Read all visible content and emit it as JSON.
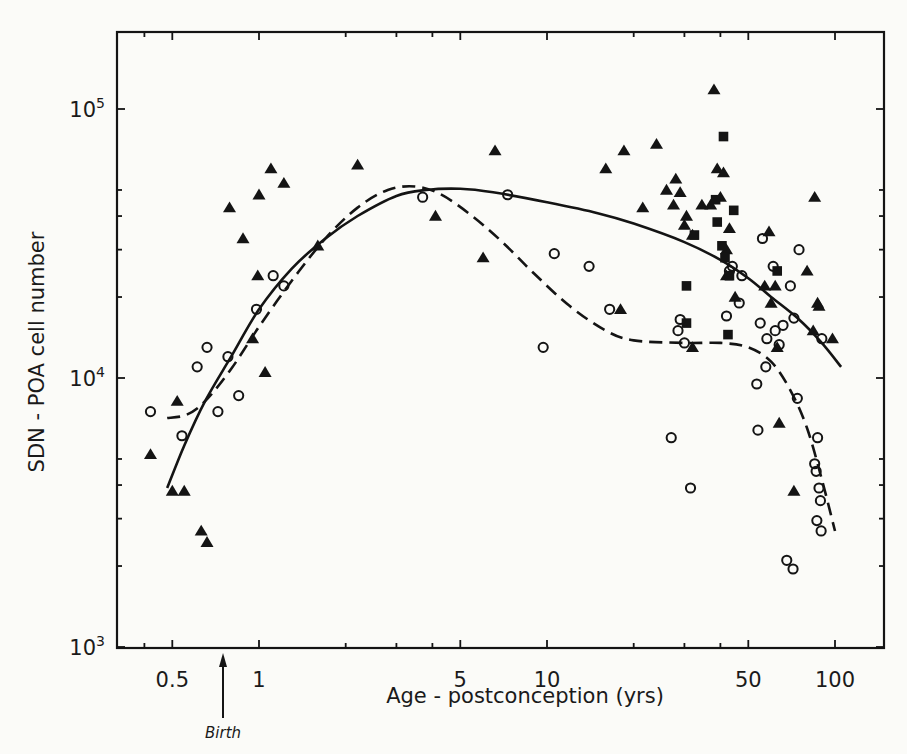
{
  "chart_data": {
    "type": "scatter",
    "title": "",
    "xlabel": "Age - postconception (yrs)",
    "ylabel": "SDN - POA cell number",
    "xscale": "log",
    "yscale": "log",
    "xlim": [
      0.32,
      160
    ],
    "ylim": [
      1000,
      200000
    ],
    "grid": false,
    "x_ticks": [
      {
        "value": 0.5,
        "label": "0.5"
      },
      {
        "value": 1,
        "label": "1"
      },
      {
        "value": 5,
        "label": "5"
      },
      {
        "value": 10,
        "label": "10"
      },
      {
        "value": 50,
        "label": "50"
      },
      {
        "value": 100,
        "label": "100"
      }
    ],
    "x_minor_ticks": [
      0.4,
      0.5,
      1,
      2,
      3,
      4,
      5,
      10,
      20,
      30,
      40,
      50,
      100
    ],
    "y_ticks": [
      {
        "value": 1000,
        "base": "10",
        "exp": "3"
      },
      {
        "value": 10000,
        "base": "10",
        "exp": "4"
      },
      {
        "value": 100000,
        "base": "10",
        "exp": "5"
      }
    ],
    "y_minor_ticks": [
      2000,
      3000,
      4000,
      5000,
      20000,
      30000,
      40000,
      50000
    ],
    "annotation": {
      "label": "Birth",
      "x": 0.75
    },
    "series": [
      {
        "name": "triangles",
        "marker": "triangle-filled",
        "points": [
          [
            0.42,
            5200
          ],
          [
            0.52,
            8200
          ],
          [
            0.5,
            3800
          ],
          [
            0.55,
            3800
          ],
          [
            0.63,
            2700
          ],
          [
            0.66,
            2450
          ],
          [
            0.79,
            43000
          ],
          [
            0.88,
            33000
          ],
          [
            0.95,
            14000
          ],
          [
            1.0,
            48000
          ],
          [
            0.99,
            24000
          ],
          [
            1.1,
            60000
          ],
          [
            1.22,
            53000
          ],
          [
            1.05,
            10500
          ],
          [
            1.6,
            31000
          ],
          [
            2.2,
            62000
          ],
          [
            4.1,
            40000
          ],
          [
            6.0,
            28000
          ],
          [
            6.6,
            70000
          ],
          [
            16.0,
            60000
          ],
          [
            18.0,
            18000
          ],
          [
            18.5,
            70000
          ],
          [
            21.5,
            43000
          ],
          [
            24.0,
            74000
          ],
          [
            26.0,
            50000
          ],
          [
            27.5,
            44000
          ],
          [
            28.0,
            55000
          ],
          [
            29.0,
            49000
          ],
          [
            30.5,
            40000
          ],
          [
            30.0,
            37000
          ],
          [
            32.0,
            34000
          ],
          [
            32.0,
            13000
          ],
          [
            34.5,
            44000
          ],
          [
            37.0,
            44000
          ],
          [
            38.0,
            118000
          ],
          [
            39.0,
            60000
          ],
          [
            40.0,
            47000
          ],
          [
            41.0,
            58000
          ],
          [
            42.0,
            30000
          ],
          [
            43.0,
            36000
          ],
          [
            45.0,
            20000
          ],
          [
            42.0,
            24000
          ],
          [
            59.0,
            35000
          ],
          [
            60.0,
            19000
          ],
          [
            62.0,
            22000
          ],
          [
            63.0,
            13000
          ],
          [
            64.0,
            6800
          ],
          [
            72.0,
            3800
          ],
          [
            80.0,
            25000
          ],
          [
            85.0,
            47000
          ],
          [
            87.0,
            19000
          ],
          [
            88.0,
            18500
          ],
          [
            84.0,
            15000
          ],
          [
            98.0,
            14000
          ],
          [
            57.0,
            22000
          ]
        ]
      },
      {
        "name": "squares",
        "marker": "square-filled",
        "points": [
          [
            41.0,
            79000
          ],
          [
            44.5,
            42000
          ],
          [
            39.0,
            38000
          ],
          [
            40.5,
            31000
          ],
          [
            32.5,
            34000
          ],
          [
            30.5,
            22000
          ],
          [
            41.5,
            28000
          ],
          [
            43.0,
            24000
          ],
          [
            30.5,
            16000
          ],
          [
            42.5,
            14500
          ],
          [
            63.0,
            25000
          ],
          [
            38.5,
            46000
          ]
        ]
      },
      {
        "name": "open-circles",
        "marker": "circle-open",
        "points": [
          [
            0.42,
            7500
          ],
          [
            0.54,
            6100
          ],
          [
            0.61,
            11000
          ],
          [
            0.66,
            13000
          ],
          [
            0.72,
            7500
          ],
          [
            0.78,
            12000
          ],
          [
            0.85,
            8600
          ],
          [
            0.98,
            18000
          ],
          [
            1.12,
            24000
          ],
          [
            1.22,
            22000
          ],
          [
            3.7,
            47000
          ],
          [
            7.3,
            48000
          ],
          [
            9.7,
            13000
          ],
          [
            10.6,
            29000
          ],
          [
            14.0,
            26000
          ],
          [
            16.5,
            18000
          ],
          [
            27.0,
            6000
          ],
          [
            28.5,
            15000
          ],
          [
            29.0,
            16500
          ],
          [
            30.0,
            13500
          ],
          [
            31.5,
            3900
          ],
          [
            42.0,
            17000
          ],
          [
            43.0,
            25000
          ],
          [
            44.0,
            26000
          ],
          [
            46.5,
            19000
          ],
          [
            47.5,
            24000
          ],
          [
            53.5,
            9500
          ],
          [
            54.0,
            6400
          ],
          [
            55.0,
            16000
          ],
          [
            56.0,
            33000
          ],
          [
            57.5,
            11000
          ],
          [
            58.0,
            14000
          ],
          [
            61.0,
            26000
          ],
          [
            62.0,
            15000
          ],
          [
            64.0,
            13300
          ],
          [
            66.0,
            15700
          ],
          [
            68.0,
            2100
          ],
          [
            70.0,
            22000
          ],
          [
            71.5,
            1950
          ],
          [
            74.0,
            8400
          ],
          [
            72.0,
            16700
          ],
          [
            75.0,
            30000
          ],
          [
            87.0,
            6000
          ],
          [
            85.0,
            4800
          ],
          [
            86.0,
            4500
          ],
          [
            88.0,
            3900
          ],
          [
            89.0,
            3500
          ],
          [
            86.5,
            2950
          ],
          [
            89.5,
            2700
          ],
          [
            90.0,
            14000
          ]
        ]
      }
    ],
    "curves": [
      {
        "name": "solid-fit",
        "style": "solid",
        "points": [
          [
            0.48,
            3900
          ],
          [
            0.55,
            5600
          ],
          [
            0.65,
            8200
          ],
          [
            0.8,
            12000
          ],
          [
            1.0,
            18000
          ],
          [
            1.3,
            25500
          ],
          [
            1.7,
            33000
          ],
          [
            2.2,
            40000
          ],
          [
            3.0,
            47500
          ],
          [
            3.8,
            50000
          ],
          [
            5.0,
            50500
          ],
          [
            6.5,
            49000
          ],
          [
            10,
            45000
          ],
          [
            15,
            41000
          ],
          [
            20,
            37500
          ],
          [
            30,
            32000
          ],
          [
            40,
            27500
          ],
          [
            50,
            23500
          ],
          [
            60,
            20000
          ],
          [
            75,
            16500
          ],
          [
            90,
            13500
          ],
          [
            105,
            11000
          ]
        ]
      },
      {
        "name": "dashed-fit",
        "style": "dashed",
        "points": [
          [
            0.48,
            7100
          ],
          [
            0.56,
            7300
          ],
          [
            0.65,
            8200
          ],
          [
            0.8,
            10800
          ],
          [
            1.0,
            15500
          ],
          [
            1.3,
            23000
          ],
          [
            1.7,
            33000
          ],
          [
            2.2,
            43000
          ],
          [
            2.8,
            50000
          ],
          [
            3.5,
            51500
          ],
          [
            4.3,
            48000
          ],
          [
            5.5,
            40000
          ],
          [
            7.0,
            32000
          ],
          [
            9.0,
            24500
          ],
          [
            12,
            18500
          ],
          [
            16,
            15000
          ],
          [
            20,
            13800
          ],
          [
            30,
            13500
          ],
          [
            40,
            13500
          ],
          [
            50,
            13000
          ],
          [
            60,
            11500
          ],
          [
            70,
            9000
          ],
          [
            80,
            6500
          ],
          [
            90,
            4200
          ],
          [
            100,
            2700
          ]
        ]
      }
    ]
  }
}
